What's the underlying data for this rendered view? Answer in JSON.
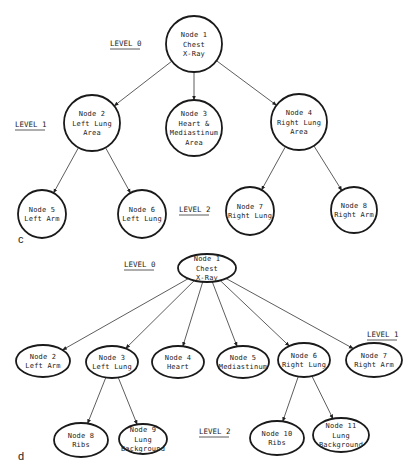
{
  "colors": {
    "background": "#ffffff",
    "stroke": "#1a1a1a",
    "text": "#222222"
  },
  "diagram_c": {
    "panel_label": "c",
    "levels": [
      {
        "label": "LEVEL 0",
        "x": 110,
        "y": 46
      },
      {
        "label": "LEVEL 1",
        "x": 15,
        "y": 127
      },
      {
        "label": "LEVEL 2",
        "x": 179,
        "y": 212
      }
    ],
    "nodes": [
      {
        "id": 1,
        "lines": [
          "Node 1",
          "Chest",
          "X-Ray"
        ],
        "cx": 194,
        "cy": 44,
        "r": 28
      },
      {
        "id": 2,
        "lines": [
          "Node 2",
          "Left Lung",
          "Area"
        ],
        "cx": 92,
        "cy": 123,
        "r": 28
      },
      {
        "id": 3,
        "lines": [
          "Node 3",
          "Heart &",
          "Mediastinum",
          "Area"
        ],
        "cx": 194,
        "cy": 128,
        "r": 28
      },
      {
        "id": 4,
        "lines": [
          "Node 4",
          "Right Lung",
          "Area"
        ],
        "cx": 299,
        "cy": 122,
        "r": 28
      },
      {
        "id": 5,
        "lines": [
          "Node 5",
          "Left Arm"
        ],
        "cx": 42,
        "cy": 214,
        "r": 24
      },
      {
        "id": 6,
        "lines": [
          "Node 6",
          "Left Lung"
        ],
        "cx": 142,
        "cy": 214,
        "r": 24
      },
      {
        "id": 7,
        "lines": [
          "Node 7",
          "Right Lung"
        ],
        "cx": 250,
        "cy": 211,
        "r": 24
      },
      {
        "id": 8,
        "lines": [
          "Node 8",
          "Right Arm"
        ],
        "cx": 354,
        "cy": 210,
        "r": 23
      }
    ],
    "edges": [
      [
        1,
        2
      ],
      [
        1,
        3
      ],
      [
        1,
        4
      ],
      [
        2,
        5
      ],
      [
        2,
        6
      ],
      [
        4,
        7
      ],
      [
        4,
        8
      ]
    ]
  },
  "diagram_d": {
    "panel_label": "d",
    "levels": [
      {
        "label": "LEVEL 0",
        "x": 124,
        "y": 267
      },
      {
        "label": "LEVEL 1",
        "x": 367,
        "y": 337
      },
      {
        "label": "LEVEL 2",
        "x": 199,
        "y": 434
      }
    ],
    "nodes": [
      {
        "id": 1,
        "lines": [
          "Node 1",
          "Chest",
          "X-Ray"
        ],
        "cx": 207,
        "cy": 268,
        "rx": 29,
        "ry": 14
      },
      {
        "id": 2,
        "lines": [
          "Node 2",
          "Left Arm"
        ],
        "cx": 43,
        "cy": 361,
        "rx": 27,
        "ry": 16
      },
      {
        "id": 3,
        "lines": [
          "Node 3",
          "Left Lung"
        ],
        "cx": 112,
        "cy": 362,
        "rx": 26,
        "ry": 16
      },
      {
        "id": 4,
        "lines": [
          "Node 4",
          "Heart"
        ],
        "cx": 178,
        "cy": 362,
        "rx": 26,
        "ry": 16
      },
      {
        "id": 5,
        "lines": [
          "Node 5",
          "Mediastinum"
        ],
        "cx": 243,
        "cy": 362,
        "rx": 26,
        "ry": 16
      },
      {
        "id": 6,
        "lines": [
          "Node 6",
          "Right Lung"
        ],
        "cx": 304,
        "cy": 360,
        "rx": 26,
        "ry": 17
      },
      {
        "id": 7,
        "lines": [
          "Node 7",
          "Right Arm"
        ],
        "cx": 374,
        "cy": 360,
        "rx": 28,
        "ry": 17
      },
      {
        "id": 8,
        "lines": [
          "Node 8",
          "Ribs"
        ],
        "cx": 81,
        "cy": 440,
        "rx": 27,
        "ry": 17
      },
      {
        "id": 9,
        "lines": [
          "Node 9",
          "Lung",
          "Background"
        ],
        "cx": 143,
        "cy": 439,
        "rx": 24,
        "ry": 15
      },
      {
        "id": 10,
        "lines": [
          "Node 10",
          "Ribs"
        ],
        "cx": 277,
        "cy": 438,
        "rx": 27,
        "ry": 17
      },
      {
        "id": 11,
        "lines": [
          "Node 11",
          "Lung",
          "Background"
        ],
        "cx": 341,
        "cy": 435,
        "rx": 28,
        "ry": 17
      }
    ],
    "edges": [
      [
        1,
        2
      ],
      [
        1,
        3
      ],
      [
        1,
        4
      ],
      [
        1,
        5
      ],
      [
        1,
        6
      ],
      [
        1,
        7
      ],
      [
        3,
        8
      ],
      [
        3,
        9
      ],
      [
        6,
        10
      ],
      [
        6,
        11
      ]
    ]
  }
}
